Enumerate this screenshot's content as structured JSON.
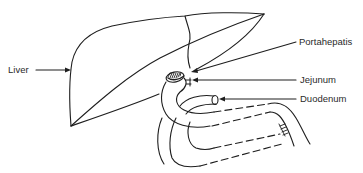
{
  "diagram": {
    "type": "anatomical-illustration",
    "labels": [
      {
        "id": "liver",
        "text": "Liver"
      },
      {
        "id": "portahepatis",
        "text": "Portahepatis"
      },
      {
        "id": "jejunum",
        "text": "Jejunum"
      },
      {
        "id": "duodenum",
        "text": "Duodenum"
      }
    ],
    "colors": {
      "line": "#1e1e1e",
      "text": "#2a2a2a",
      "background": "#ffffff"
    }
  }
}
